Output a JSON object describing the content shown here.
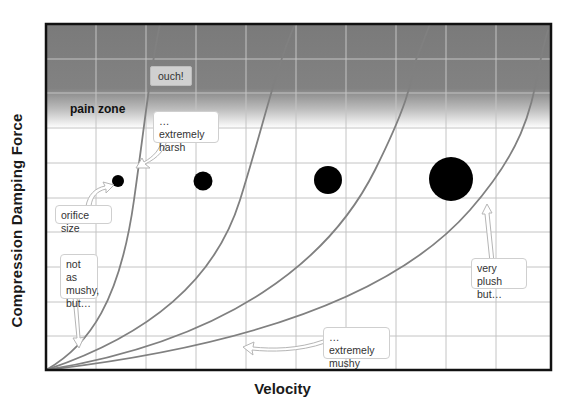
{
  "axes": {
    "x_label": "Velocity",
    "y_label": "Compression Damping Force"
  },
  "zones": {
    "pain_zone_label": "pain zone"
  },
  "annotations": {
    "ouch": "ouch!",
    "extremely_harsh": "… extremely\nharsh",
    "orifice_size": "orifice size",
    "not_as_mushy": "not as\nmushy,\nbut…",
    "extremely_mushy": "… extremely\nmushy",
    "very_plush": "very plush\nbut…"
  },
  "curves": [
    {
      "name": "smallest-orifice",
      "description": "steepest curve, extremely harsh"
    },
    {
      "name": "small-orifice",
      "description": "not as mushy"
    },
    {
      "name": "large-orifice",
      "description": "very plush"
    },
    {
      "name": "largest-orifice",
      "description": "extremely mushy"
    }
  ],
  "orifices": [
    {
      "name": "orifice-1",
      "radius": 6
    },
    {
      "name": "orifice-2",
      "radius": 9.5
    },
    {
      "name": "orifice-3",
      "radius": 14
    },
    {
      "name": "orifice-4",
      "radius": 22
    }
  ],
  "colors": {
    "frame": "#111111",
    "grid": "#c4c4c4",
    "curve": "#808080",
    "pain_zone": "#7a7a7a",
    "dot": "#000000"
  }
}
